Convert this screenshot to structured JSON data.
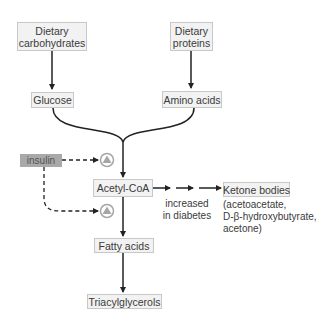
{
  "diagram": {
    "nodes": {
      "dietary_carbohydrates": {
        "line1": "Dietary",
        "line2": "carbohydrates"
      },
      "dietary_proteins": {
        "line1": "Dietary",
        "line2": "proteins"
      },
      "glucose": "Glucose",
      "amino_acids": "Amino acids",
      "insulin": "insulin",
      "acetyl_coa": "Acetyl-CoA",
      "ketone_bodies": "Ketone bodies",
      "fatty_acids": "Fatty acids",
      "triacylglycerols": "Triacylglycerols"
    },
    "annotations": {
      "increased_line1": "increased",
      "increased_line2": "in diabetes",
      "ketone_examples_line1": "(acetoacetate,",
      "ketone_examples_line2": "D-β-hydroxybutyrate,",
      "ketone_examples_line3": "acetone)"
    },
    "edges": [
      {
        "from": "Dietary carbohydrates",
        "to": "Glucose",
        "style": "solid"
      },
      {
        "from": "Dietary proteins",
        "to": "Amino acids",
        "style": "solid"
      },
      {
        "from": "Glucose",
        "to": "Acetyl-CoA",
        "style": "solid-merge"
      },
      {
        "from": "Amino acids",
        "to": "Acetyl-CoA",
        "style": "solid-merge"
      },
      {
        "from": "Acetyl-CoA",
        "to": "Ketone bodies",
        "style": "dashed"
      },
      {
        "from": "Acetyl-CoA",
        "to": "Fatty acids",
        "style": "solid"
      },
      {
        "from": "Fatty acids",
        "to": "Triacylglycerols",
        "style": "solid"
      },
      {
        "from": "insulin",
        "to": "stimulation-symbol-top",
        "style": "dashed"
      },
      {
        "from": "insulin",
        "to": "stimulation-symbol-bottom",
        "style": "dashed"
      }
    ],
    "colors": {
      "box_fill": "#f2f2f2",
      "box_border": "#c8c8c8",
      "insulin_fill": "#a9a9a9",
      "symbol_gray": "#a6a6a6",
      "line": "#222222"
    }
  }
}
